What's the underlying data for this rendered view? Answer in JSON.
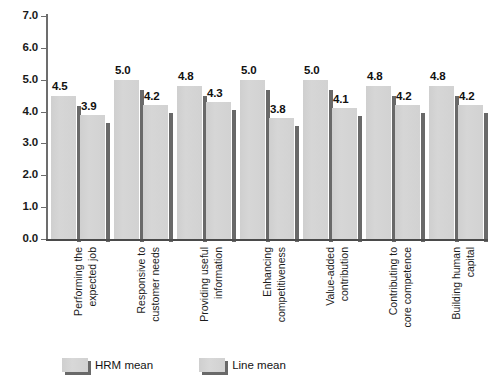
{
  "chart_data": {
    "type": "bar",
    "title": "",
    "subtitle": "",
    "xlabel": "",
    "ylabel": "",
    "ylim": [
      0.0,
      7.0
    ],
    "ytick_step": 1.0,
    "yticks": [
      "7.0",
      "6.0",
      "5.0",
      "4.0",
      "3.0",
      "2.0",
      "1.0",
      "0.0"
    ],
    "ytick_values": [
      7.0,
      6.0,
      5.0,
      4.0,
      3.0,
      2.0,
      1.0,
      0.0
    ],
    "grid": false,
    "legend_position": "bottom-center",
    "orientation": "vertical-grouped",
    "categories": [
      "Performing the expected job",
      "Responsive to customer needs",
      "Providing useful information",
      "Enhancing competitiveness",
      "Value-added contribution",
      "Contributing to core competence",
      "Building human capital"
    ],
    "category_lines": [
      [
        "Performing the",
        "expected job"
      ],
      [
        "Responsive to",
        "customer needs"
      ],
      [
        "Providing useful",
        "information"
      ],
      [
        "Enhancing",
        "competitiveness"
      ],
      [
        "Value-added",
        "contribution"
      ],
      [
        "Contributing to",
        "core competence"
      ],
      [
        "Building human",
        "capital"
      ]
    ],
    "series": [
      {
        "name": "HRM mean",
        "values": [
          4.5,
          5.0,
          4.8,
          5.0,
          5.0,
          4.8,
          4.8
        ],
        "labels": [
          "4.5",
          "5.0",
          "4.8",
          "5.0",
          "5.0",
          "4.8",
          "4.8"
        ],
        "color": "#d3d3d3"
      },
      {
        "name": "Line mean",
        "values": [
          3.9,
          4.2,
          4.3,
          3.8,
          4.1,
          4.2,
          4.2
        ],
        "labels": [
          "3.9",
          "4.2",
          "4.3",
          "3.8",
          "4.1",
          "4.2",
          "4.2"
        ],
        "color": "#d3d3d3"
      }
    ]
  },
  "legend": {
    "items": [
      {
        "label": "HRM mean"
      },
      {
        "label": "Line mean"
      }
    ]
  },
  "colors": {
    "bar_fill": "#d3d3d3",
    "bar_shadow": "#4f4f4f",
    "axis": "#4a4a4a",
    "text": "#101010",
    "background": "#ffffff"
  }
}
